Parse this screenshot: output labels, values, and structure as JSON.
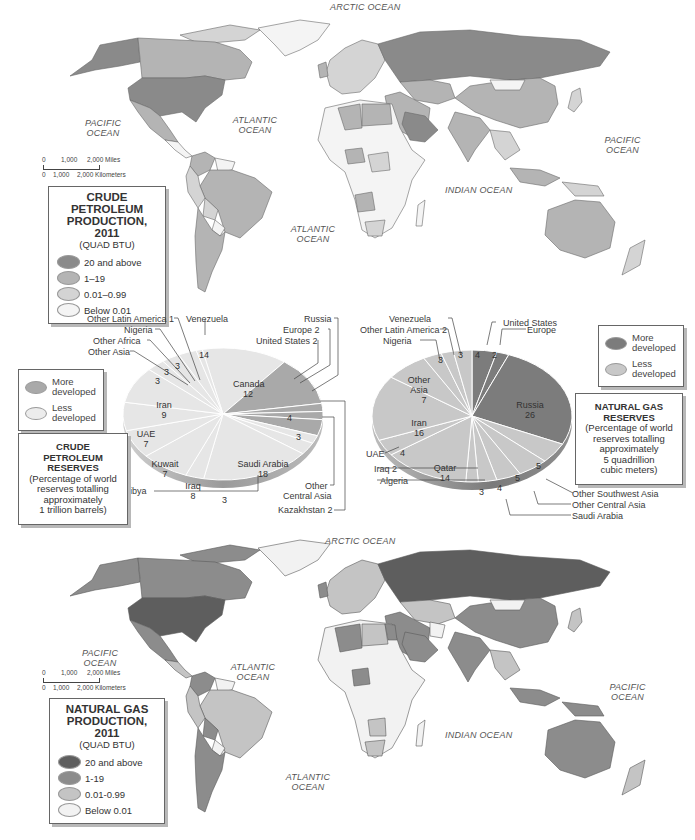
{
  "top_map": {
    "oceans": {
      "arctic": "ARCTIC OCEAN",
      "pacific_west": "PACIFIC OCEAN",
      "atlantic_north": "ATLANTIC OCEAN",
      "atlantic_south": "ATLANTIC OCEAN",
      "indian": "INDIAN OCEAN",
      "pacific_east": "PACIFIC OCEAN"
    },
    "scale": {
      "miles_ticks": [
        "0",
        "1,000",
        "2,000 Miles"
      ],
      "km_ticks": [
        "0",
        "1,000",
        "2,000 Kilometers"
      ]
    },
    "legend": {
      "title_line1": "CRUDE PETROLEUM",
      "title_line2": "PRODUCTION, 2011",
      "subtitle": "(QUAD BTU)",
      "items": [
        {
          "label": "20 and above",
          "color": "#8a8a8a"
        },
        {
          "label": "1–19",
          "color": "#b4b4b4"
        },
        {
          "label": "0.01–0.99",
          "color": "#d4d4d4"
        },
        {
          "label": "Below 0.01",
          "color": "#f4f4f4"
        }
      ]
    }
  },
  "bottom_map": {
    "oceans": {
      "arctic": "ARCTIC OCEAN",
      "pacific_west": "PACIFIC OCEAN",
      "atlantic_north": "ATLANTIC OCEAN",
      "atlantic_south": "ATLANTIC OCEAN",
      "indian": "INDIAN OCEAN",
      "pacific_east": "PACIFIC OCEAN"
    },
    "scale": {
      "miles_ticks": [
        "0",
        "1,000",
        "2,000 Miles"
      ],
      "km_ticks": [
        "0",
        "1,000",
        "2,000 Kilometers"
      ]
    },
    "legend": {
      "title_line1": "NATURAL GAS",
      "title_line2": "PRODUCTION, 2011",
      "subtitle": "(QUAD BTU)",
      "items": [
        {
          "label": "20 and above",
          "color": "#5e5e5e"
        },
        {
          "label": "1-19",
          "color": "#8c8c8c"
        },
        {
          "label": "0.01-0.99",
          "color": "#c4c4c4"
        },
        {
          "label": "Below 0.01",
          "color": "#f2f2f2"
        }
      ]
    }
  },
  "petroleum_panel": {
    "dev_legend": [
      {
        "label_1": "More",
        "label_2": "developed",
        "color": "#a9a9a9"
      },
      {
        "label_1": "Less",
        "label_2": "developed",
        "color": "#ececec"
      }
    ],
    "description": {
      "title_1": "CRUDE",
      "title_2": "PETROLEUM",
      "title_3": "RESERVES",
      "line_1": "(Percentage of world",
      "line_2": "reserves totalling",
      "line_3": "approximately",
      "line_4": "1 trillion barrels)"
    }
  },
  "gas_panel": {
    "dev_legend": [
      {
        "label_1": "More",
        "label_2": "developed",
        "color": "#7c7c7c"
      },
      {
        "label_1": "Less",
        "label_2": "developed",
        "color": "#c8c8c8"
      }
    ],
    "description": {
      "title_1": "NATURAL GAS",
      "title_2": "RESERVES",
      "line_1": "(Percentage of world",
      "line_2": "reserves totalling",
      "line_3": "approximately",
      "line_4": "5 quadrillion",
      "line_5": "cubic meters)"
    }
  },
  "chart_data": [
    {
      "type": "pie",
      "title": "CRUDE PETROLEUM RESERVES (Percentage of world reserves totalling approximately 1 trillion barrels)",
      "legend": [
        "More developed",
        "Less developed"
      ],
      "categories": [
        "Venezuela",
        "Canada",
        "United States",
        "Europe",
        "Russia",
        "Kazakhstan",
        "Other Central Asia",
        "Saudi Arabia",
        "Libya",
        "Iraq",
        "Kuwait",
        "UAE",
        "Iran",
        "Other Asia",
        "Other Africa",
        "Nigeria",
        "Other Latin America"
      ],
      "values": [
        14,
        12,
        2,
        2,
        4,
        2,
        3,
        18,
        3,
        8,
        7,
        7,
        9,
        3,
        3,
        3,
        1
      ],
      "development": [
        "less",
        "more",
        "more",
        "more",
        "more",
        "less",
        "less",
        "less",
        "less",
        "less",
        "less",
        "less",
        "less",
        "less",
        "less",
        "less",
        "less"
      ]
    },
    {
      "type": "pie",
      "title": "NATURAL GAS RESERVES (Percentage of world reserves totalling approximately 5 quadrillion cubic meters)",
      "legend": [
        "More developed",
        "Less developed"
      ],
      "categories": [
        "United States",
        "Europe",
        "Russia",
        "Other Southwest Asia",
        "Other Central Asia",
        "Saudi Arabia",
        "Algeria",
        "Iraq",
        "Qatar",
        "UAE",
        "Iran",
        "Other Asia",
        "Nigeria",
        "Other Latin America",
        "Venezuela"
      ],
      "values": [
        4,
        2,
        26,
        5,
        5,
        4,
        3,
        2,
        14,
        4,
        16,
        7,
        3,
        2,
        3
      ],
      "development": [
        "more",
        "more",
        "more",
        "less",
        "less",
        "less",
        "less",
        "less",
        "less",
        "less",
        "less",
        "less",
        "less",
        "less",
        "less"
      ]
    }
  ],
  "pie_labels": {
    "oil": {
      "other_latin_america": "Other Latin America 1",
      "nigeria": "Nigeria",
      "other_africa": "Other Africa",
      "other_asia": "Other Asia",
      "venezuela": "Venezuela",
      "russia": "Russia",
      "europe": "Europe 2",
      "united_states": "United States 2",
      "other_central_asia_1": "Other",
      "other_central_asia_2": "Central Asia",
      "kazakhstan": "Kazakhstan 2",
      "libya": "Libya",
      "v_venezuela": "14",
      "v_canada_name": "Canada",
      "v_canada": "12",
      "v_russia": "4",
      "v_oca": "3",
      "v_saudi_name": "Saudi Arabia",
      "v_saudi": "18",
      "v_libya": "3",
      "v_iraq_name": "Iraq",
      "v_iraq": "8",
      "v_kuwait_name": "Kuwait",
      "v_kuwait": "7",
      "v_uae_name": "UAE",
      "v_uae": "7",
      "v_iran_name": "Iran",
      "v_iran": "9",
      "v_other_asia": "3",
      "v_other_africa": "3",
      "v_nigeria": "3"
    },
    "gas": {
      "venezuela": "Venezuela",
      "other_latin_america": "Other Latin America 2",
      "nigeria": "Nigeria",
      "united_states": "United States",
      "europe": "Europe",
      "uae": "UAE",
      "iraq": "Iraq 2",
      "algeria": "Algeria",
      "other_sw_asia": "Other Southwest Asia",
      "other_central_asia": "Other Central Asia",
      "saudi_arabia": "Saudi Arabia",
      "v_us": "4",
      "v_europe": "2",
      "v_venezuela": "3",
      "v_nigeria": "3",
      "v_russia_name": "Russia",
      "v_russia": "26",
      "v_other_asia_1": "Other",
      "v_other_asia_2": "Asia",
      "v_other_asia": "7",
      "v_iran_name": "Iran",
      "v_iran": "16",
      "v_uae": "4",
      "v_qatar_name": "Qatar",
      "v_qatar": "14",
      "v_algeria": "3",
      "v_saudi": "4",
      "v_ocasia": "5",
      "v_oswasia": "5"
    }
  }
}
